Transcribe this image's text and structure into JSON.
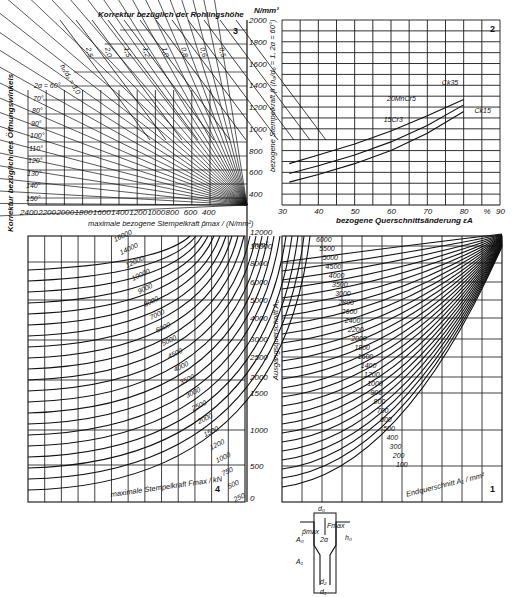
{
  "chart_data": [
    {
      "id": "chart-3",
      "panel_number": "3",
      "type": "line",
      "title": "Korrektur bezüglich der Rohlingshöhe",
      "left_label": "Korrektur bezüglich des Öffnungswinkels",
      "xlabel": "maximale bezogene Stempelkraft p̄max / (N/mm²)",
      "x_ticks": [
        2400,
        2200,
        2000,
        1800,
        1600,
        1400,
        1200,
        1000,
        800,
        600,
        400
      ],
      "height_ratio_label": "h₀/d₀ = 3,0",
      "height_ratio_values": [
        "2,5",
        "2,0",
        "1,5",
        "1,2",
        "1,0",
        "0,8",
        "0,6",
        "0,5"
      ],
      "angle_label_prefix": "2α = ",
      "angle_values": [
        "60°",
        "70°",
        "80°",
        "90°",
        "100°",
        "110°",
        "120°",
        "130°",
        "140°",
        "150°"
      ]
    },
    {
      "id": "chart-2",
      "panel_number": "2",
      "type": "line",
      "ylabel": "bezogene Stempelkraft p̄ (h₀/d₀ = 1, 2α = 60°)",
      "y_unit": "N/mm²",
      "y_ticks": [
        400,
        600,
        800,
        1000,
        1200,
        1400,
        1600,
        1800,
        2000
      ],
      "ylim": [
        0,
        2000
      ],
      "xlabel": "bezogene Querschnittsänderung εA",
      "x_unit": "%",
      "x_ticks": [
        30,
        40,
        50,
        60,
        70,
        80,
        90
      ],
      "xlim": [
        30,
        90
      ],
      "grid": true,
      "x": [
        30,
        40,
        50,
        60,
        70,
        80
      ],
      "series": [
        {
          "name": "20MnCr5",
          "values": [
            680,
            760,
            860,
            980,
            1120,
            1270
          ]
        },
        {
          "name": "Ck35",
          "values": [
            680,
            760,
            860,
            980,
            1120,
            1270
          ]
        },
        {
          "name": "15Cr3",
          "values": [
            590,
            660,
            760,
            880,
            1030,
            1220
          ]
        },
        {
          "name": "Ck15",
          "values": [
            510,
            580,
            680,
            800,
            960,
            1160
          ]
        }
      ]
    },
    {
      "id": "chart-4",
      "panel_number": "4",
      "type": "line",
      "curve_label": "maximale Stempelkraft Fmax / kN",
      "curve_values": [
        16000,
        14000,
        12000,
        10000,
        9000,
        8000,
        7000,
        6000,
        5000,
        4500,
        4000,
        3500,
        3000,
        2500,
        2000,
        1500,
        1200,
        1000,
        750,
        500,
        250
      ],
      "grid": true
    },
    {
      "id": "chart-1",
      "panel_number": "1",
      "type": "line",
      "ylabel": "Ausgangsquerschnitt A₀",
      "y_unit": "mm²",
      "y_ticks": [
        0,
        500,
        1000,
        1500,
        2000,
        2500,
        3000,
        4000,
        5000,
        6000,
        8000,
        10000,
        12000
      ],
      "curve_label": "Endquerschnitt A₁ / mm²",
      "curve_values": [
        6000,
        5500,
        5000,
        4500,
        4000,
        3500,
        3000,
        2800,
        2600,
        2400,
        2200,
        2000,
        1800,
        1600,
        1400,
        1200,
        1000,
        900,
        800,
        700,
        600,
        500,
        400,
        300,
        200,
        100
      ],
      "grid": true
    }
  ],
  "chart3": {
    "title": "Korrektur bezüglich der Rohlingshöhe",
    "left_label": "Korrektur bezüglich des Öffnungswinkels",
    "xlabel": "maximale bezogene Stempelkraft p̄max / (N/mm²)",
    "panel": "3"
  },
  "chart2": {
    "unit": "N/mm²",
    "ylabel": "bezogene Stempelkraft p̄ (h₀/d₀ = 1, 2α = 60°)",
    "xlabel": "bezogene Querschnittsänderung εA",
    "x_unit": "%",
    "panel": "2"
  },
  "chart1": {
    "unit": "mm²",
    "ylabel": "Ausgangsquerschnitt A₀",
    "curve_label": "Endquerschnitt A₁ / mm²",
    "panel": "1"
  },
  "chart4": {
    "curve_label": "maximale Stempelkraft Fmax / kN",
    "panel": "4"
  },
  "diagram": {
    "d0": "d₀",
    "Fmax": "Fmax",
    "pmax": "p̄max",
    "h0": "h₀",
    "A0": "A₀",
    "two_alpha": "2α",
    "A1": "A₁",
    "d2": "d₂",
    "d1": "d₁"
  }
}
